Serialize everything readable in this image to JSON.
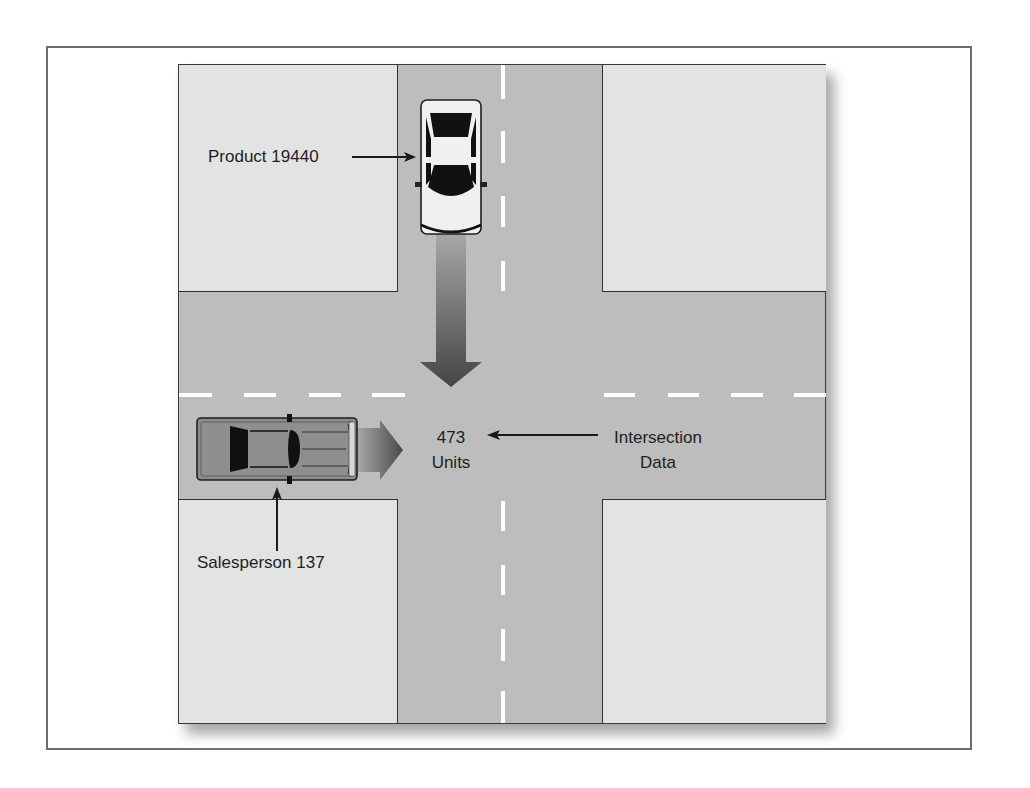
{
  "diagram": {
    "type": "intersection-analogy",
    "labels": {
      "product": "Product 19440",
      "salesperson": "Salesperson 137",
      "intersection_value": "473",
      "intersection_unit": "Units",
      "intersection_caption_line1": "Intersection",
      "intersection_caption_line2": "Data"
    },
    "vehicles": [
      {
        "name": "product-car",
        "color": "white",
        "direction": "south"
      },
      {
        "name": "salesperson-car",
        "color": "gray",
        "direction": "east"
      }
    ],
    "colors": {
      "road": "#bdbdbd",
      "block": "#e3e3e3",
      "lane_marking": "#ffffff",
      "outline": "#2f2f2f",
      "frame": "#6e6e6e"
    }
  }
}
